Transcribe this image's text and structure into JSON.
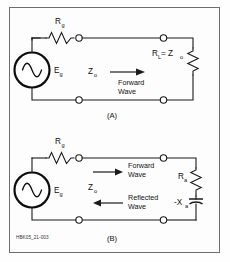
{
  "figure": {
    "id_code": "HBK05_21-003",
    "background": "#fdfdfd",
    "line_color": "#1b1b1b"
  },
  "panel_a": {
    "caption": "(A)",
    "source_label": "E",
    "source_sub": "g",
    "source_icon": "ac-source-icon",
    "series_resistor_label": "R",
    "series_resistor_sub": "g",
    "impedance_label": "Z",
    "impedance_sub": "o",
    "wave_line1": "Forward",
    "wave_line2": "Wave",
    "load_label": "R",
    "load_sub": "L",
    "load_equals": " = Z",
    "load_equals_sub": "o"
  },
  "panel_b": {
    "caption": "(B)",
    "source_label": "E",
    "source_sub": "g",
    "source_icon": "ac-source-icon",
    "series_resistor_label": "R",
    "series_resistor_sub": "g",
    "impedance_label": "Z",
    "impedance_sub": "o",
    "forward_line1": "Forward",
    "forward_line2": "Wave",
    "reflected_line1": "Reflected",
    "reflected_line2": "Wave",
    "load_resistor_label": "R",
    "load_resistor_sub": "a",
    "load_reactance_label": "-X",
    "load_reactance_sub": "a"
  }
}
